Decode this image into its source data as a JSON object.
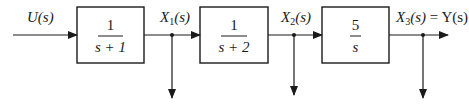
{
  "diagram": {
    "type": "block-diagram-cascade",
    "input": {
      "label": "U(s)"
    },
    "blocks": [
      {
        "id": "G1",
        "numerator": "1",
        "denominator": "s + 1"
      },
      {
        "id": "G2",
        "numerator": "1",
        "denominator": "s + 2"
      },
      {
        "id": "G3",
        "numerator": "5",
        "denominator": "s"
      }
    ],
    "signals": [
      {
        "name": "X",
        "sub": "1",
        "arg": "(s)",
        "suffix": ""
      },
      {
        "name": "X",
        "sub": "2",
        "arg": "(s)",
        "suffix": ""
      },
      {
        "name": "X",
        "sub": "3",
        "arg": "(s)",
        "suffix": " = Y(s)"
      }
    ],
    "branch_taps": 3,
    "colors": {
      "line": "#1a1a1a",
      "background": "#ffffff"
    }
  }
}
